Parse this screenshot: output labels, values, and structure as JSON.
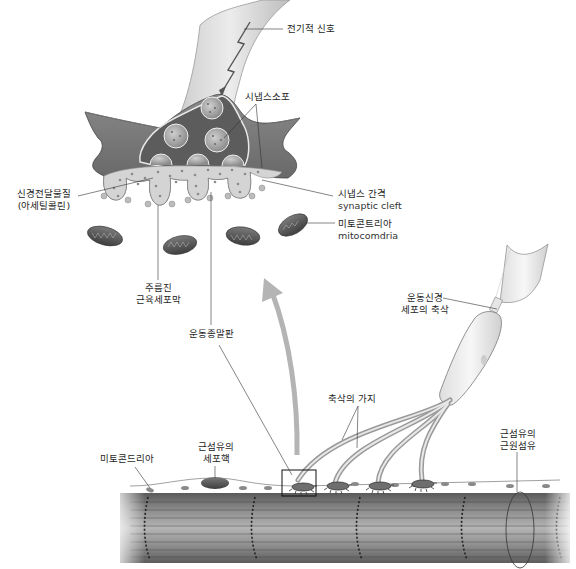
{
  "diagram": {
    "colors": {
      "background": "#ffffff",
      "terminal_dark": "#6e6e6e",
      "terminal_mid": "#9a9a9a",
      "cleft_light": "#d6d6d6",
      "muscle_fiber": "#7a7a7a",
      "arrow": "#b4b4b4",
      "leader_line": "#333333",
      "label_text": "#1e1e1e"
    },
    "inset_labels": {
      "electrical_signal": "전기적 신호",
      "synaptic_vesicle": "시냅스소포",
      "neurotransmitter_line1": "신경전달물질",
      "neurotransmitter_line2": "(아세틸콜린)",
      "synaptic_cleft_ko": "시냅스 간격",
      "synaptic_cleft_en": "synaptic cleft",
      "mitochondria_ko": "미토콘트리아",
      "mitochondria_en": "mitocomdria",
      "folded_membrane_line1": "주름진",
      "folded_membrane_line2": "근육세포막"
    },
    "main_labels": {
      "motor_end_plate": "운동종말판",
      "motor_neuron_axon_line1": "운동신경",
      "motor_neuron_axon_line2": "세포의 축삭",
      "axon_branches": "축삭의 가지",
      "mitochondria": "미토콘드리아",
      "muscle_nucleus_line1": "근섬유의",
      "muscle_nucleus_line2": "세포핵",
      "myofibril_line1": "근섬유의",
      "myofibril_line2": "근원섬유"
    },
    "nodes": [
      {
        "id": "axon-terminal",
        "label": "전기적 신호"
      },
      {
        "id": "synaptic-vesicles",
        "label": "시냅스소포"
      },
      {
        "id": "acetylcholine",
        "label": "신경전달물질 (아세틸콜린)"
      },
      {
        "id": "synaptic-cleft",
        "label": "시냅스 간격 synaptic cleft"
      },
      {
        "id": "inset-mitochondria",
        "label": "미토콘트리아 mitocomdria"
      },
      {
        "id": "junctional-folds",
        "label": "주름진 근육세포막"
      },
      {
        "id": "motor-end-plate",
        "label": "운동종말판"
      },
      {
        "id": "motor-axon",
        "label": "운동신경 세포의 축삭"
      },
      {
        "id": "axon-branches",
        "label": "축삭의 가지"
      },
      {
        "id": "mitochondria",
        "label": "미토콘드리아"
      },
      {
        "id": "muscle-nucleus",
        "label": "근섬유의 세포핵"
      },
      {
        "id": "myofibril",
        "label": "근섬유의 근원섬유"
      }
    ],
    "edges": [
      {
        "from": "motor-end-plate",
        "to": "axon-terminal",
        "type": "zoom-arrow"
      },
      {
        "from": "motor-axon",
        "to": "axon-branches",
        "type": "continuation"
      }
    ]
  }
}
